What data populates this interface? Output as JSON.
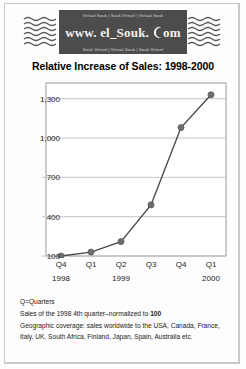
{
  "logo": {
    "top_strip": "Virtual Souk | Souk Virtuel | Virtual Souk",
    "main_pre": "www. el_Souk.",
    "main_post": "om",
    "bottom_strip": "Souk Virtuel | Virtual Souk | Souk Virtuel",
    "moon_icon": "crescent-moon-icon",
    "background": "#4c4c4c"
  },
  "notes": {
    "line1": "Q=Quarters",
    "line2_pre": "Sales of the 1998 4th quarter–normalized to ",
    "line2_bold": "100",
    "line3": "Geographic coverage: sales worldwide to the USA, Canada, France, Italy, UK, South Africa, Finland, Japan, Spain, Australia etc."
  },
  "chart_data": {
    "type": "line",
    "title": "Relative Increase of Sales: 1998-2000",
    "xlabel": "",
    "ylabel": "",
    "categories": [
      "Q4",
      "Q1",
      "Q2",
      "Q3",
      "Q4",
      "Q1"
    ],
    "year_groups": [
      {
        "label": "1998",
        "index": 0
      },
      {
        "label": "1999",
        "index": 2
      },
      {
        "label": "2000",
        "index": 5
      }
    ],
    "values": [
      100,
      130,
      210,
      490,
      1080,
      1330
    ],
    "ytick_labels": [
      "1,300",
      "1,000",
      "700",
      "400",
      "100"
    ],
    "yticks": [
      1300,
      1000,
      700,
      400,
      100
    ],
    "ylim": [
      100,
      1420
    ],
    "grid": true,
    "legend": "none",
    "marker": "circle",
    "line_color": "#4a4a4a",
    "marker_color": "#6e6e6e",
    "grid_color": "#c6c6c6",
    "frame_color": "#9a9a9a"
  }
}
